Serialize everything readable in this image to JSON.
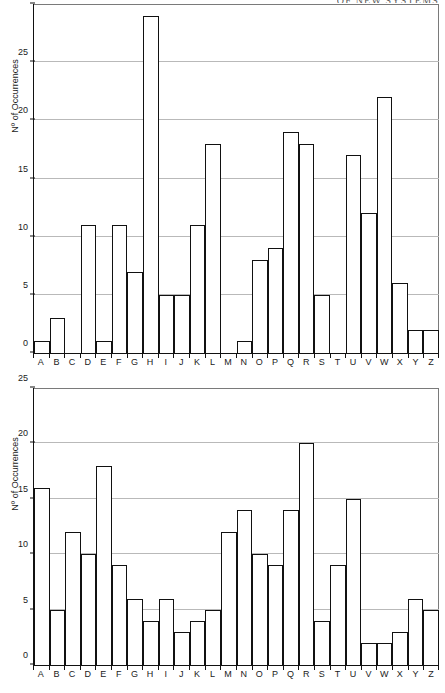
{
  "running_head": "OF NEW SYSTEMS",
  "chart_data": [
    {
      "type": "bar",
      "id": "figure-top",
      "title": "",
      "xlabel": "",
      "ylabel": "Nº of Occurrences",
      "ylim": [
        0,
        30
      ],
      "yticks": [
        0,
        5,
        10,
        15,
        20,
        25,
        30
      ],
      "grid": true,
      "legend": null,
      "categories": [
        "A",
        "B",
        "C",
        "D",
        "E",
        "F",
        "G",
        "H",
        "I",
        "J",
        "K",
        "L",
        "M",
        "N",
        "O",
        "P",
        "Q",
        "R",
        "S",
        "T",
        "U",
        "V",
        "W",
        "X",
        "Y",
        "Z"
      ],
      "values": [
        1,
        3,
        0,
        11,
        1,
        11,
        7,
        29,
        5,
        5,
        11,
        18,
        0,
        1,
        8,
        9,
        19,
        18,
        5,
        0,
        17,
        12,
        22,
        6,
        2,
        2
      ]
    },
    {
      "type": "bar",
      "id": "figure-bottom",
      "title": "",
      "xlabel": "",
      "ylabel": "Nº of Occurrences",
      "ylim": [
        0,
        25
      ],
      "yticks": [
        0,
        5,
        10,
        15,
        20,
        25
      ],
      "grid": true,
      "legend": null,
      "categories": [
        "A",
        "B",
        "C",
        "D",
        "E",
        "F",
        "G",
        "H",
        "I",
        "J",
        "K",
        "L",
        "M",
        "N",
        "O",
        "P",
        "Q",
        "R",
        "S",
        "T",
        "U",
        "V",
        "W",
        "X",
        "Y",
        "Z"
      ],
      "values": [
        16,
        5,
        12,
        10,
        18,
        9,
        6,
        4,
        6,
        3,
        4,
        5,
        12,
        14,
        10,
        9,
        14,
        20,
        4,
        9,
        15,
        2,
        2,
        3,
        6,
        5
      ]
    }
  ]
}
